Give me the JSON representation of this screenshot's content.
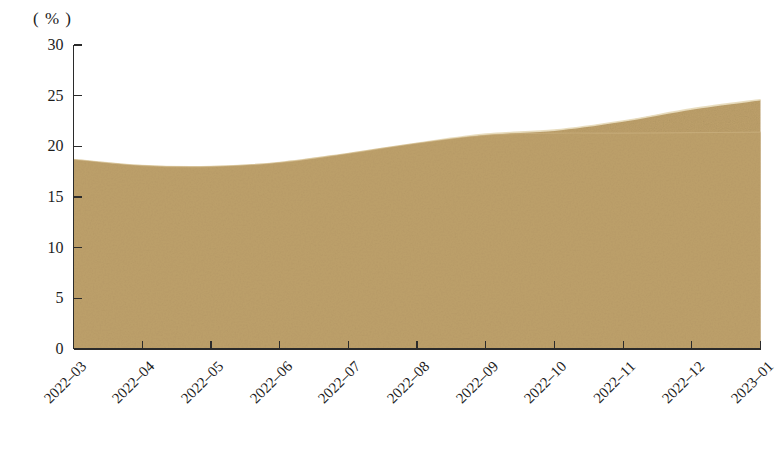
{
  "chart_data": {
    "type": "area",
    "title": "",
    "subtitle": "",
    "xlabel": "",
    "ylabel": "",
    "unit_label": "( % )",
    "categories": [
      "2022-03",
      "2022-04",
      "2022-05",
      "2022-06",
      "2022-07",
      "2022-08",
      "2022-09",
      "2022-10",
      "2022-11",
      "2022-12",
      "2023-01"
    ],
    "series": [
      {
        "name": "primary-area",
        "values": [
          18.7,
          18.1,
          18.0,
          18.4,
          19.3,
          20.3,
          21.2,
          21.6,
          22.5,
          23.7,
          24.6
        ],
        "fill_color": "#bda06a",
        "edge_color": "#e8dcbe"
      },
      {
        "name": "secondary-overlay",
        "values": [
          18.7,
          18.1,
          18.0,
          18.4,
          19.3,
          20.3,
          21.1,
          21.3,
          21.3,
          21.35,
          21.4
        ],
        "fill_color": "#bda06a",
        "edge_color": "#cdb484"
      }
    ],
    "ylim": [
      0,
      30
    ],
    "yticks": [
      0,
      5,
      10,
      15,
      20,
      25,
      30
    ],
    "ytick_labels": [
      "0",
      "5",
      "10",
      "15",
      "20",
      "25",
      "30"
    ],
    "xtick_rotation": -45,
    "grid": false,
    "legend": "none",
    "axis_color": "#2b2b2b",
    "background_color": "#ffffff"
  }
}
